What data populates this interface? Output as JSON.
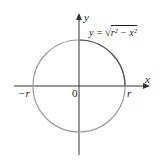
{
  "diagram": {
    "equation_lhs": "y = ",
    "equation_radicand": "r² − x²",
    "axis_x_label": "x",
    "axis_y_label": "y",
    "origin_label": "0",
    "left_intercept_label": "−r",
    "right_intercept_label": "r",
    "colors": {
      "axes": "#333333",
      "circle": "#9a9a9a",
      "upper_arc": "#555555"
    }
  }
}
